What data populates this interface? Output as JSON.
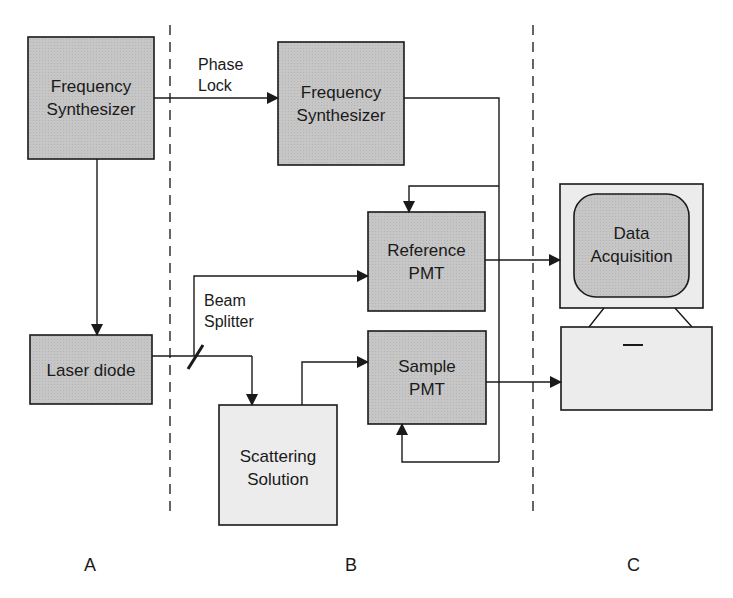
{
  "diagram": {
    "type": "block-diagram",
    "sections": [
      {
        "id": "A",
        "label": "A"
      },
      {
        "id": "B",
        "label": "B"
      },
      {
        "id": "C",
        "label": "C"
      }
    ],
    "blocks": {
      "freq_synth_a": {
        "line1": "Frequency",
        "line2": "Synthesizer",
        "section": "A"
      },
      "freq_synth_b": {
        "line1": "Frequency",
        "line2": "Synthesizer",
        "section": "B"
      },
      "laser_diode": {
        "line1": "Laser diode",
        "section": "A"
      },
      "reference_pmt": {
        "line1": "Reference",
        "line2": "PMT",
        "section": "B"
      },
      "sample_pmt": {
        "line1": "Sample",
        "line2": "PMT",
        "section": "B"
      },
      "scattering_solution": {
        "line1": "Scattering",
        "line2": "Solution",
        "section": "B"
      },
      "data_acquisition": {
        "line1": "Data",
        "line2": "Acquisition",
        "section": "C"
      }
    },
    "annotations": {
      "phase_lock": {
        "line1": "Phase",
        "line2": "Lock"
      },
      "beam_splitter": {
        "line1": "Beam",
        "line2": "Splitter"
      }
    },
    "connections": [
      {
        "from": "freq_synth_a",
        "to": "freq_synth_b",
        "label": "Phase Lock"
      },
      {
        "from": "freq_synth_a",
        "to": "laser_diode"
      },
      {
        "from": "laser_diode",
        "to": "beam_splitter"
      },
      {
        "from": "beam_splitter",
        "to": "reference_pmt"
      },
      {
        "from": "beam_splitter",
        "to": "scattering_solution"
      },
      {
        "from": "scattering_solution",
        "to": "sample_pmt"
      },
      {
        "from": "freq_synth_b",
        "to": "reference_pmt"
      },
      {
        "from": "freq_synth_b",
        "to": "sample_pmt"
      },
      {
        "from": "reference_pmt",
        "to": "data_acquisition"
      },
      {
        "from": "sample_pmt",
        "to": "data_acquisition"
      }
    ],
    "colors": {
      "dark_block": "#c4c4c4",
      "light_block": "#ebebeb",
      "stroke": "#1a1a1a"
    }
  }
}
